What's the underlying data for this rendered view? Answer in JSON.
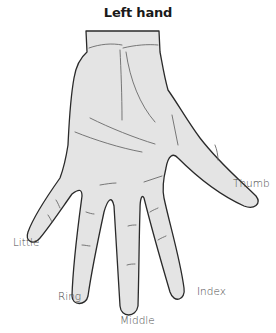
{
  "title": "Left hand",
  "colors": {
    "skin_fill": "#e4e4e4",
    "outline": "#2a2a2a",
    "crease": "#6a6a6a",
    "label": "#4a4a4a"
  },
  "fingers": [
    {
      "id": "thumb",
      "label": "Thumb"
    },
    {
      "id": "index",
      "label": "Index"
    },
    {
      "id": "middle",
      "label": "Middle"
    },
    {
      "id": "ring",
      "label": "Ring"
    },
    {
      "id": "little",
      "label": "Little"
    }
  ]
}
